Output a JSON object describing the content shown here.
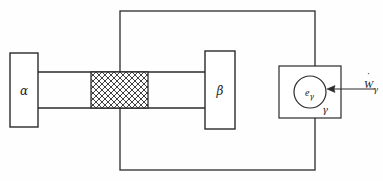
{
  "figure": {
    "title": "",
    "background_color": "#fefefe",
    "line_color": "#2a2a2a"
  },
  "blocks": {
    "alpha": {
      "label": "α",
      "name": "alpha-block",
      "x": 10,
      "y": 53,
      "w": 28,
      "h": 74
    },
    "beta": {
      "label": "β",
      "name": "beta-block",
      "x": 205,
      "y": 51,
      "w": 30,
      "h": 78
    },
    "gamma_box": {
      "label": "γ",
      "name": "gamma-block",
      "x": 279,
      "y": 66,
      "w": 62,
      "h": 52
    }
  },
  "connector": {
    "name": "rod",
    "top_y": 72,
    "bottom_y": 108,
    "left_x": 38,
    "right_x": 205
  },
  "hatched_region": {
    "name": "hatched-resistor",
    "label": "",
    "x": 91,
    "y": 72,
    "w": 57,
    "h": 36,
    "pattern": "cross-hatch-diagonal"
  },
  "boundary": {
    "name": "control-boundary",
    "label": "",
    "x": 120,
    "y": 11,
    "w": 195,
    "h": 159
  },
  "gamma_circle": {
    "label": "e",
    "subscript": "γ",
    "name": "energy-node",
    "cx": 310,
    "cy": 92,
    "r": 16
  },
  "work_arrow": {
    "label": "W",
    "subscript": "γ",
    "dot": "̇",
    "name": "work-input-arrow",
    "from_x": 375,
    "to_x": 328,
    "y": 89
  },
  "gamma_label": {
    "text": "γ",
    "x": 325,
    "y": 112
  },
  "legend": {
    "items": []
  }
}
